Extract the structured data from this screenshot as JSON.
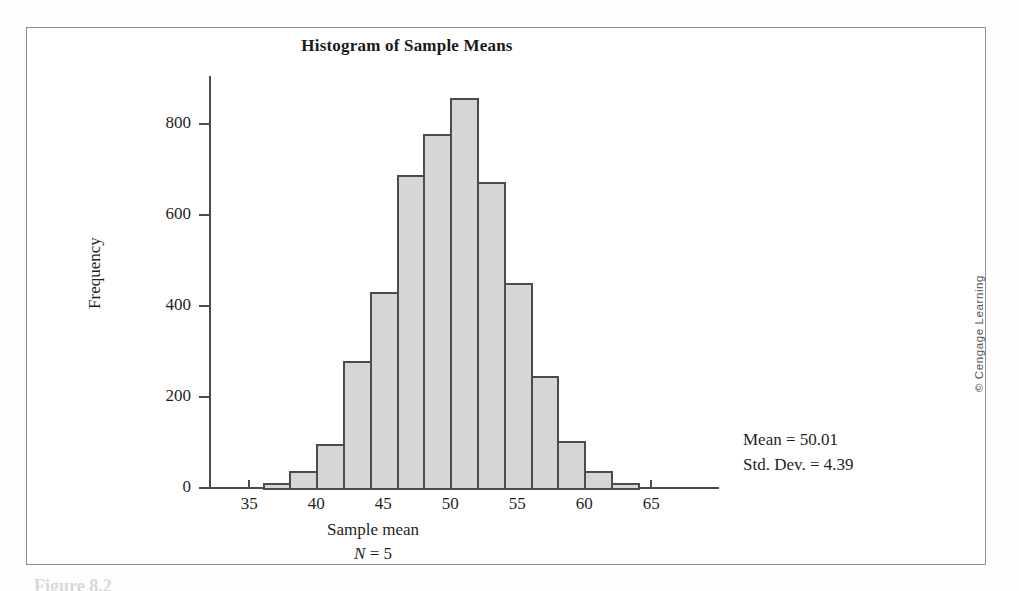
{
  "figure": {
    "caption_partial": "Figure 8.2",
    "copyright": "© Cengage Learning"
  },
  "chart_data": {
    "type": "bar",
    "title": "Histogram of Sample Means",
    "xlabel": "Sample mean",
    "xlabel_sub_prefix": "N",
    "xlabel_sub_suffix": " = 5",
    "ylabel": "Frequency",
    "xlim": [
      32,
      68
    ],
    "ylim": [
      0,
      900
    ],
    "grid": false,
    "legend": "none",
    "bin_width": 2,
    "x_ticks": [
      35,
      40,
      45,
      50,
      55,
      60,
      65
    ],
    "x_tick_labels": [
      "35",
      "40",
      "45",
      "50",
      "55",
      "60",
      "65"
    ],
    "y_ticks": [
      0,
      200,
      400,
      600,
      800
    ],
    "y_tick_labels": [
      "0",
      "200",
      "400",
      "600",
      "800"
    ],
    "bin_starts": [
      36,
      38,
      40,
      42,
      44,
      46,
      48,
      50,
      52,
      54,
      56,
      58,
      60,
      62
    ],
    "bin_ends": [
      38,
      40,
      42,
      44,
      46,
      48,
      50,
      52,
      54,
      56,
      58,
      60,
      62,
      64
    ],
    "categories": [
      "36-38",
      "38-40",
      "40-42",
      "42-44",
      "44-46",
      "46-48",
      "48-50",
      "50-52",
      "52-54",
      "54-56",
      "56-58",
      "58-60",
      "60-62",
      "62-64"
    ],
    "values": [
      10,
      38,
      97,
      280,
      430,
      687,
      778,
      858,
      672,
      450,
      247,
      103,
      37,
      10
    ],
    "annotations": [
      "Mean = 50.01",
      "Std. Dev. = 4.39"
    ],
    "colors": {
      "bar_fill": "#d6d6d6",
      "bar_border": "#4c4c4c",
      "axis": "#4c4c4c",
      "text": "#1f1f1f",
      "frame": "#8e8e8e",
      "background": "#ffffff"
    }
  },
  "stats": {
    "mean_line": "Mean = 50.01",
    "stddev_line": "Std. Dev. = 4.39"
  }
}
